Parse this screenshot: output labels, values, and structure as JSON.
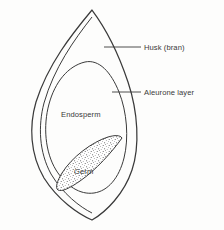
{
  "figure": {
    "kind": "botanical-cross-section",
    "background_color": "#fdfdfc",
    "line_color": "#3a3a3a",
    "text_color": "#3a3a3a"
  },
  "labels": {
    "husk": "Husk (bran)",
    "aleurone": "Aleurone layer",
    "endosperm": "Endosperm",
    "germ": "Germ"
  },
  "parts": [
    {
      "id": "husk",
      "label": "Husk (bran)",
      "label_position": "outside-right",
      "has_leader_line": true
    },
    {
      "id": "aleurone",
      "label": "Aleurone layer",
      "label_position": "outside-right",
      "has_leader_line": true
    },
    {
      "id": "endosperm",
      "label": "Endosperm",
      "label_position": "inside",
      "has_leader_line": false
    },
    {
      "id": "germ",
      "label": "Germ",
      "label_position": "inside",
      "has_leader_line": false,
      "fill": "stippled"
    }
  ]
}
